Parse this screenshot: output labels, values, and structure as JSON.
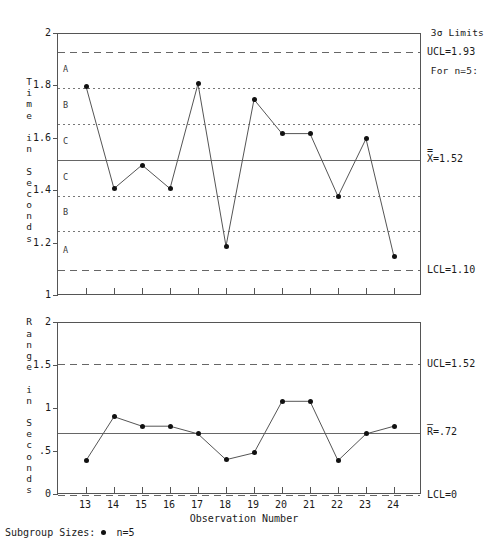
{
  "header": {
    "note_line1": "3σ Limits",
    "note_line2": "For n=5:"
  },
  "legend": {
    "label": "Subgroup Sizes:",
    "sample": "n=5",
    "marker_icon": "filled-circle-icon"
  },
  "xaxis": {
    "title": "Observation Number",
    "ticks": [
      "13",
      "14",
      "15",
      "16",
      "17",
      "18",
      "19",
      "20",
      "21",
      "22",
      "23",
      "24"
    ]
  },
  "xbar_chart": {
    "yaxis_title": "Time\nin\nSeconds",
    "yticks": [
      "1",
      "1.2",
      "1.4",
      "1.6",
      "1.8",
      "2"
    ],
    "ylim": [
      1,
      2
    ],
    "ucl_label": "UCL=1.93",
    "center_label": "X=1.52",
    "center_bar": "=",
    "lcl_label": "LCL=1.10",
    "zone_letters": [
      "A",
      "B",
      "C",
      "C",
      "B",
      "A"
    ]
  },
  "range_chart": {
    "yaxis_title": "Range\nin\nSeconds",
    "yticks": [
      "0",
      ".5",
      "1",
      "1.5",
      "2"
    ],
    "ylim": [
      0,
      2
    ],
    "ucl_label": "UCL=1.52",
    "center_label": "R=.72",
    "center_bar": "—",
    "lcl_label": "LCL=0"
  },
  "chart_data": [
    {
      "type": "line",
      "title": "X-bar Control Chart",
      "xlabel": "Observation Number",
      "ylabel": "Time in Seconds",
      "x": [
        13,
        14,
        15,
        16,
        17,
        18,
        19,
        20,
        21,
        22,
        23,
        24
      ],
      "values": [
        1.8,
        1.41,
        1.5,
        1.41,
        1.81,
        1.19,
        1.75,
        1.62,
        1.62,
        1.38,
        1.6,
        1.15
      ],
      "ylim": [
        1,
        2
      ],
      "yticks": [
        1,
        1.2,
        1.4,
        1.6,
        1.8,
        2
      ],
      "center_line": 1.52,
      "ucl": 1.93,
      "lcl": 1.1,
      "zone_lines": [
        1.7933,
        1.6567,
        1.3833,
        1.2467
      ],
      "zones": [
        "A",
        "B",
        "C",
        "C",
        "B",
        "A"
      ],
      "grid": false,
      "legend": "n=5"
    },
    {
      "type": "line",
      "title": "R Control Chart",
      "xlabel": "Observation Number",
      "ylabel": "Range in Seconds",
      "x": [
        13,
        14,
        15,
        16,
        17,
        18,
        19,
        20,
        21,
        22,
        23,
        24
      ],
      "values": [
        0.4,
        0.91,
        0.8,
        0.8,
        0.71,
        0.41,
        0.49,
        1.09,
        1.09,
        0.4,
        0.71,
        0.8
      ],
      "ylim": [
        0,
        2
      ],
      "yticks": [
        0,
        0.5,
        1,
        1.5,
        2
      ],
      "center_line": 0.72,
      "ucl": 1.52,
      "lcl": 0,
      "grid": false,
      "legend": "n=5"
    }
  ]
}
